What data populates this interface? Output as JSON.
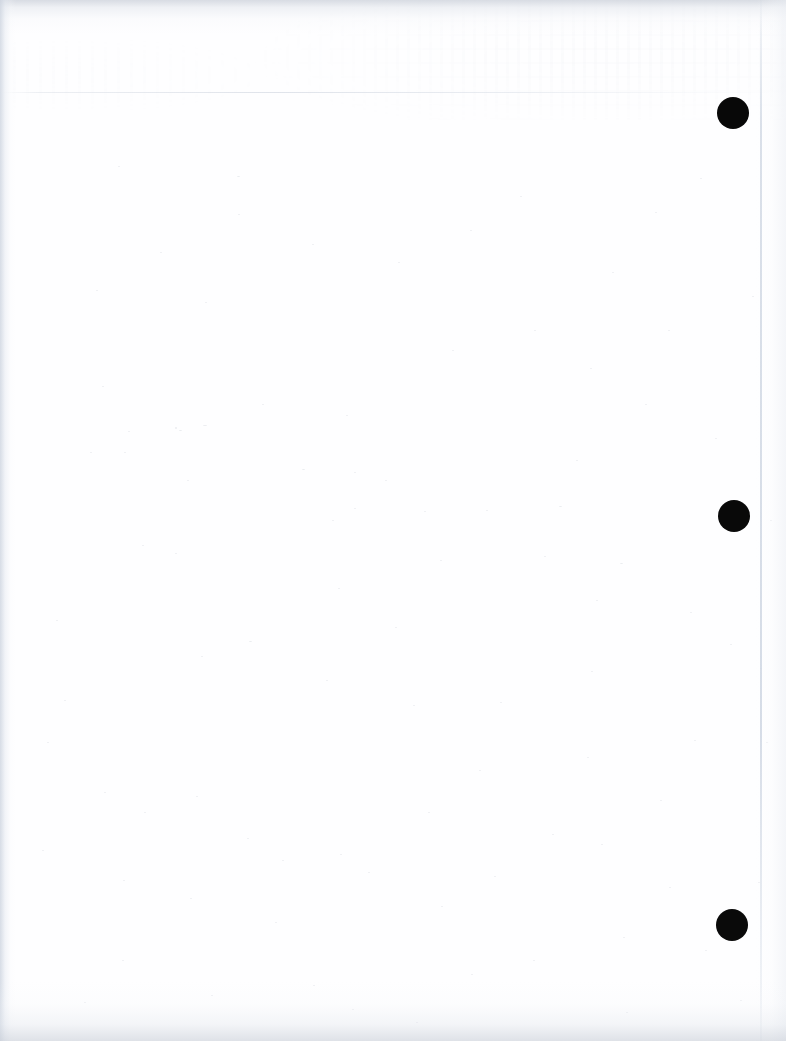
{
  "document": {
    "type": "scanned-page",
    "description": "Blank scanned sheet of paper",
    "page_width": 786,
    "page_height": 1041,
    "paper_color": "#fefeff",
    "background_color": "#ffffff",
    "text_content": "",
    "visible_text": []
  },
  "marks": {
    "label": "punch-hole registration marks",
    "color": "#080808",
    "count": 3,
    "items": [
      {
        "name": "punch-mark-top",
        "cx": 733,
        "cy": 113,
        "diameter": 32,
        "color": "#080808"
      },
      {
        "name": "punch-mark-middle",
        "cx": 734,
        "cy": 516,
        "diameter": 32,
        "color": "#090909"
      },
      {
        "name": "punch-mark-bottom",
        "cx": 732,
        "cy": 925,
        "diameter": 32,
        "color": "#0a0a0a"
      }
    ]
  },
  "artifacts": {
    "paper_edge_line": {
      "name": "paper-edge-line",
      "x": 760,
      "color": "#ccd4e1"
    },
    "scan_line": {
      "name": "scan-line-horizontal",
      "y": 92,
      "color": "#d6dbe4"
    },
    "edge_shadow_color": "#ced5e0",
    "ghost_showthrough_color": "#c4cad4"
  },
  "speckles": [
    [
      118,
      166,
      2,
      1
    ],
    [
      237,
      176,
      3,
      1
    ],
    [
      205,
      302,
      2,
      1
    ],
    [
      262,
      404,
      2,
      1
    ],
    [
      175,
      427,
      2,
      2
    ],
    [
      179,
      430,
      3,
      1
    ],
    [
      203,
      425,
      4,
      1
    ],
    [
      128,
      431,
      2,
      1
    ],
    [
      124,
      452,
      2,
      1
    ],
    [
      346,
      415,
      2,
      1
    ],
    [
      187,
      480,
      2,
      1
    ],
    [
      302,
      469,
      3,
      1
    ],
    [
      424,
      511,
      2,
      1
    ],
    [
      354,
      472,
      2,
      1
    ],
    [
      486,
      510,
      2,
      1
    ],
    [
      559,
      506,
      3,
      1
    ],
    [
      102,
      386,
      2,
      1
    ],
    [
      90,
      452,
      2,
      1
    ],
    [
      354,
      508,
      2,
      1
    ],
    [
      332,
      520,
      2,
      1
    ],
    [
      385,
      480,
      2,
      1
    ],
    [
      142,
      545,
      2,
      1
    ],
    [
      175,
      553,
      2,
      1
    ],
    [
      338,
      588,
      2,
      1
    ],
    [
      395,
      627,
      2,
      1
    ],
    [
      249,
      641,
      3,
      1
    ],
    [
      201,
      656,
      2,
      1
    ],
    [
      326,
      680,
      2,
      1
    ],
    [
      440,
      560,
      2,
      1
    ],
    [
      544,
      556,
      2,
      1
    ],
    [
      596,
      600,
      2,
      1
    ],
    [
      620,
      563,
      3,
      1
    ],
    [
      591,
      671,
      2,
      1
    ],
    [
      413,
      705,
      2,
      1
    ],
    [
      500,
      702,
      2,
      1
    ],
    [
      690,
      612,
      2,
      1
    ],
    [
      730,
      644,
      2,
      1
    ],
    [
      760,
      668,
      2,
      1
    ],
    [
      587,
      757,
      2,
      1
    ],
    [
      479,
      770,
      2,
      1
    ],
    [
      428,
      812,
      2,
      1
    ],
    [
      104,
      792,
      2,
      1
    ],
    [
      144,
      812,
      2,
      1
    ],
    [
      196,
      796,
      2,
      1
    ],
    [
      247,
      838,
      2,
      1
    ],
    [
      340,
      854,
      2,
      1
    ],
    [
      282,
      860,
      2,
      1
    ],
    [
      368,
      872,
      2,
      1
    ],
    [
      123,
      880,
      2,
      1
    ],
    [
      190,
      898,
      2,
      1
    ],
    [
      275,
      922,
      2,
      1
    ],
    [
      441,
      906,
      2,
      1
    ],
    [
      494,
      876,
      2,
      1
    ],
    [
      552,
      834,
      2,
      1
    ],
    [
      601,
      844,
      2,
      1
    ],
    [
      660,
      800,
      2,
      1
    ],
    [
      669,
      887,
      2,
      1
    ],
    [
      623,
      937,
      2,
      1
    ],
    [
      533,
      960,
      2,
      1
    ],
    [
      471,
      974,
      2,
      1
    ],
    [
      313,
      985,
      2,
      1
    ],
    [
      211,
      995,
      2,
      1
    ],
    [
      122,
      960,
      2,
      1
    ],
    [
      84,
      1002,
      2,
      1
    ],
    [
      352,
      1009,
      2,
      1
    ],
    [
      416,
      1022,
      2,
      1
    ],
    [
      626,
      1012,
      2,
      1
    ],
    [
      705,
      950,
      2,
      1
    ],
    [
      740,
      1000,
      2,
      1
    ],
    [
      758,
      882,
      2,
      1
    ],
    [
      56,
      620,
      2,
      1
    ],
    [
      64,
      700,
      2,
      1
    ],
    [
      47,
      742,
      2,
      1
    ],
    [
      42,
      850,
      2,
      1
    ],
    [
      668,
      330,
      2,
      1
    ],
    [
      612,
      272,
      2,
      1
    ],
    [
      655,
      212,
      2,
      1
    ],
    [
      700,
      178,
      2,
      1
    ],
    [
      520,
      196,
      2,
      1
    ],
    [
      470,
      230,
      2,
      1
    ],
    [
      398,
      262,
      2,
      1
    ],
    [
      312,
      244,
      2,
      1
    ],
    [
      238,
      214,
      2,
      1
    ],
    [
      160,
      252,
      2,
      1
    ],
    [
      96,
      290,
      2,
      1
    ],
    [
      534,
      330,
      2,
      1
    ],
    [
      590,
      368,
      2,
      1
    ],
    [
      645,
      404,
      2,
      1
    ],
    [
      715,
      438,
      2,
      1
    ],
    [
      752,
      296,
      2,
      1
    ],
    [
      770,
      520,
      2,
      1
    ],
    [
      766,
      742,
      2,
      1
    ],
    [
      694,
      740,
      2,
      1
    ],
    [
      576,
      460,
      2,
      1
    ],
    [
      452,
      350,
      2,
      1
    ]
  ]
}
